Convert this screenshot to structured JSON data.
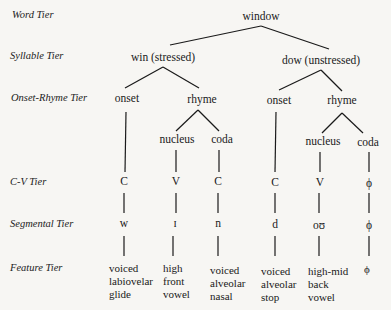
{
  "tiers": {
    "word": "Word Tier",
    "syllable": "Syllable Tier",
    "onset_rhyme": "Onset-Rhyme Tier",
    "cv": "C-V Tier",
    "segmental": "Segmental Tier",
    "feature": "Feature Tier"
  },
  "word": "window",
  "syllables": [
    {
      "label": "win (stressed)",
      "onset": "onset",
      "rhyme": "rhyme",
      "nucleus": "nucleus",
      "coda": "coda",
      "cv": [
        "C",
        "V",
        "C"
      ],
      "segments": [
        "w",
        "ɪ",
        "n"
      ],
      "features": [
        [
          "voiced",
          "labiovelar",
          "glide"
        ],
        [
          "high",
          "front",
          "vowel"
        ],
        [
          "voiced",
          "alveolar",
          "nasal"
        ]
      ]
    },
    {
      "label": "dow (unstressed)",
      "onset": "onset",
      "rhyme": "rhyme",
      "nucleus": "nucleus",
      "coda": "coda",
      "cv": [
        "C",
        "V",
        "ϕ"
      ],
      "segments": [
        "d",
        "oʊ",
        "ϕ"
      ],
      "features": [
        [
          "voiced",
          "alveolar",
          "stop"
        ],
        [
          "high-mid",
          "back",
          "vowel"
        ],
        [
          "ϕ"
        ]
      ]
    }
  ]
}
